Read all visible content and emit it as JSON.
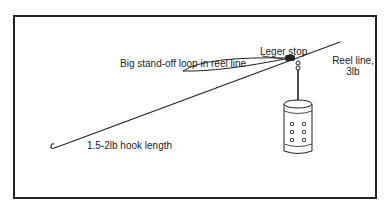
{
  "diagram": {
    "type": "fishing-rig-illustration",
    "labels": {
      "leger_stop": "Leger stop",
      "standoff_loop": "Big stand-off loop in reel line",
      "reel_line_1": "Reel line,",
      "reel_line_2": "3lb",
      "hook_length": "1.5-2lb hook length"
    },
    "components": [
      "hook",
      "hook-length-line",
      "stand-off-loop",
      "leger-stop",
      "swivel-link",
      "swimfeeder",
      "reel-line"
    ],
    "colors": {
      "line": "#222222",
      "background": "#ffffff"
    }
  }
}
